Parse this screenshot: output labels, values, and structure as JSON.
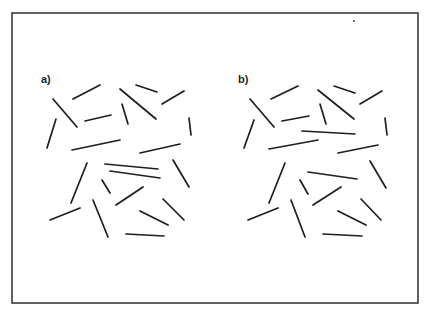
{
  "figure": {
    "frame": {
      "x1": 12,
      "y1": 13,
      "x2": 418,
      "y2": 303
    },
    "speck": {
      "x": 354,
      "y": 21
    },
    "panels": [
      {
        "label": "a)",
        "label_pos": {
          "x": 41,
          "y": 83
        },
        "segments": [
          [
            73,
            99,
            100,
            85
          ],
          [
            53,
            99,
            77,
            127
          ],
          [
            85,
            121,
            111,
            115
          ],
          [
            120,
            89,
            156,
            119
          ],
          [
            122,
            104,
            128,
            124
          ],
          [
            136,
            85,
            157,
            92
          ],
          [
            162,
            104,
            184,
            91
          ],
          [
            189,
            118,
            191,
            135
          ],
          [
            56,
            119,
            47,
            148
          ],
          [
            72,
            150,
            120,
            140
          ],
          [
            140,
            153,
            180,
            144
          ],
          [
            87,
            163,
            71,
            203
          ],
          [
            105,
            164,
            158,
            169
          ],
          [
            110,
            171,
            160,
            178
          ],
          [
            102,
            180,
            110,
            193
          ],
          [
            116,
            205,
            143,
            187
          ],
          [
            173,
            160,
            189,
            187
          ],
          [
            50,
            220,
            80,
            208
          ],
          [
            93,
            200,
            108,
            237
          ],
          [
            140,
            211,
            168,
            225
          ],
          [
            163,
            199,
            184,
            220
          ],
          [
            126,
            234,
            164,
            236
          ]
        ]
      },
      {
        "label": "b)",
        "label_pos": {
          "x": 238,
          "y": 83
        },
        "segments": [
          [
            271,
            99,
            298,
            86
          ],
          [
            250,
            99,
            274,
            127
          ],
          [
            282,
            121,
            309,
            116
          ],
          [
            318,
            90,
            354,
            119
          ],
          [
            320,
            104,
            326,
            124
          ],
          [
            334,
            86,
            355,
            93
          ],
          [
            360,
            104,
            382,
            91
          ],
          [
            385,
            118,
            387,
            135
          ],
          [
            254,
            120,
            244,
            148
          ],
          [
            269,
            149,
            318,
            140
          ],
          [
            338,
            153,
            378,
            145
          ],
          [
            302,
            131,
            355,
            134
          ],
          [
            285,
            163,
            269,
            203
          ],
          [
            308,
            172,
            357,
            179
          ],
          [
            300,
            180,
            308,
            194
          ],
          [
            313,
            205,
            341,
            187
          ],
          [
            370,
            161,
            386,
            188
          ],
          [
            248,
            220,
            278,
            208
          ],
          [
            291,
            200,
            305,
            237
          ],
          [
            338,
            211,
            366,
            225
          ],
          [
            361,
            199,
            381,
            220
          ],
          [
            323,
            234,
            362,
            236
          ]
        ]
      }
    ]
  }
}
